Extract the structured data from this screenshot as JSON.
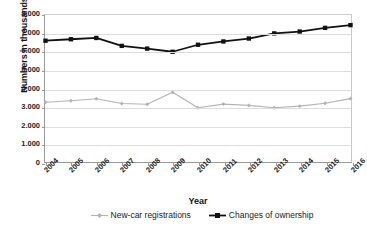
{
  "chart_data": {
    "type": "line",
    "title": "",
    "xlabel": "Year",
    "ylabel": "Numbers in thousands",
    "categories": [
      "2004",
      "2005",
      "2006",
      "2007",
      "2008",
      "2009",
      "2010",
      "2011",
      "2012",
      "2013",
      "2014",
      "2015",
      "2016"
    ],
    "ylim": [
      0,
      8000
    ],
    "ytick_labels": [
      "8.000",
      "7.000",
      "6.000",
      "5.000",
      "4.000",
      "3.000",
      "2.000",
      "1.000",
      "0"
    ],
    "ytick_values": [
      8000,
      7000,
      6000,
      5000,
      4000,
      3000,
      2000,
      1000,
      0
    ],
    "grid": true,
    "legend_position": "bottom",
    "series": [
      {
        "name": "New-car registrations",
        "color": "#b3b3b3",
        "marker": "diamond",
        "values": [
          3250,
          3330,
          3440,
          3180,
          3140,
          3800,
          2950,
          3150,
          3080,
          2950,
          3040,
          3200,
          3450
        ]
      },
      {
        "name": "Changes of ownership",
        "color": "#111111",
        "marker": "square",
        "values": [
          6600,
          6680,
          6750,
          6320,
          6170,
          6000,
          6380,
          6560,
          6720,
          7000,
          7100,
          7300,
          7450
        ]
      }
    ]
  },
  "legend": {
    "items": [
      {
        "label": "New-car registrations"
      },
      {
        "label": "Changes of ownership"
      }
    ]
  },
  "axes": {
    "x_title": "Year",
    "y_title": "Numbers in thousands"
  }
}
